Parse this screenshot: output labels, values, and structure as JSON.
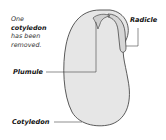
{
  "diagram": {
    "note": {
      "line1": "One",
      "line2": "cotyledon",
      "line3": "has been",
      "line4": "removed."
    },
    "labels": {
      "radicle": "Radicle",
      "plumule": "Plumule",
      "cotyledon": "Cotyledon"
    },
    "colors": {
      "seed_fill": "#e6e6e6",
      "outline": "#333333",
      "background": "#ffffff"
    }
  }
}
